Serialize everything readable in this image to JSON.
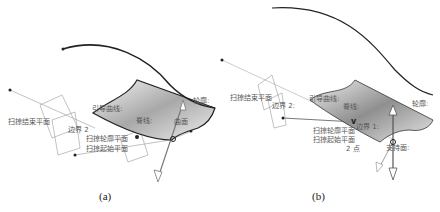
{
  "figure": {
    "panels": [
      {
        "caption": "(a)",
        "labels": {
          "sweep_end_plane": "扫掠结束平面",
          "boundary": "边界 2",
          "guide_curve": "引导曲线:",
          "spine": "脊线:",
          "profile_plane": "扫掠轮廓平面",
          "sweep_start_plane": "扫掠起始平面",
          "surface": "曲面",
          "profile": "轮廓:"
        }
      },
      {
        "caption": "(b)",
        "labels": {
          "sweep_end_plane": "扫掠结束平面",
          "boundary2": "边界 2:",
          "guide_curve": "引导曲线:",
          "spine": "脊线:",
          "profile_plane": "扫掠轮廓平面",
          "boundary1": "边界 1:",
          "sweep_start_plane": "扫掠起始平面",
          "origin": "2 点",
          "profile": "轮廓:",
          "surface": "支持面:"
        }
      }
    ],
    "colors": {
      "curve": "#222222",
      "surface_light": "#f2f2f2",
      "surface_dark": "#9a9a9a",
      "construction": "#8a8a8a",
      "label": "#555555"
    }
  }
}
